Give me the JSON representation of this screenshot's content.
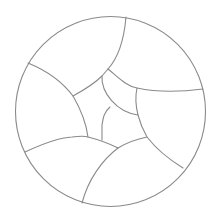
{
  "diagram": {
    "type": "circle-partition",
    "stroke_color": "#8a8a8a",
    "background": "#ffffff",
    "circle": {
      "cx": 110.5,
      "cy": 111.5,
      "r": 95
    },
    "cell_count": 11
  }
}
